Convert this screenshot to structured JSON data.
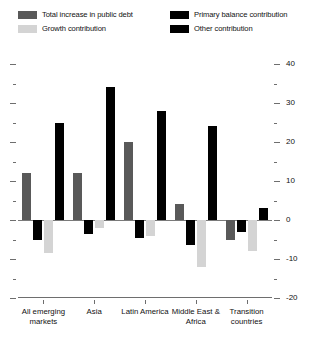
{
  "legend": {
    "entries": [
      {
        "label": "Total increase in public debt",
        "color": "#595959",
        "name": "legend-total-increase"
      },
      {
        "label": "Growth contribution",
        "color": "#d4d4d4",
        "name": "legend-growth"
      },
      {
        "label": "Primary balance contribution",
        "color": "#000000",
        "name": "legend-primary-balance"
      },
      {
        "label": "Other contribution",
        "color": "#000000",
        "name": "legend-other"
      }
    ]
  },
  "axis": {
    "y_ticks_major": [
      "40",
      "30",
      "20",
      "10",
      "0",
      "-10",
      "-20"
    ],
    "y_tick_values": [
      40,
      30,
      20,
      10,
      0,
      -10,
      -20
    ],
    "y_minor_values": [
      35,
      25,
      15,
      5,
      -5,
      -15
    ]
  },
  "chart_data": {
    "type": "bar",
    "title": "",
    "subtitle": "",
    "xlabel": "",
    "ylabel": "",
    "ylim": [
      -20,
      40
    ],
    "grid": false,
    "legend_position": "top",
    "categories": [
      "All emerging markets",
      "Asia",
      "Latin America",
      "Middle East & Africa",
      "Transition countries"
    ],
    "series": [
      {
        "name": "Total increase in public debt",
        "color": "#595959",
        "values": [
          12,
          12,
          20,
          4,
          -5
        ]
      },
      {
        "name": "Primary balance contribution",
        "color": "#000000",
        "values": [
          -5,
          -3.5,
          -4.5,
          -6.5,
          -3
        ]
      },
      {
        "name": "Growth contribution",
        "color": "#d4d4d4",
        "values": [
          -8.5,
          -2,
          -4,
          -12,
          -8
        ]
      },
      {
        "name": "Other contribution",
        "color": "#000000",
        "values": [
          25,
          34,
          28,
          24,
          3
        ]
      }
    ]
  }
}
